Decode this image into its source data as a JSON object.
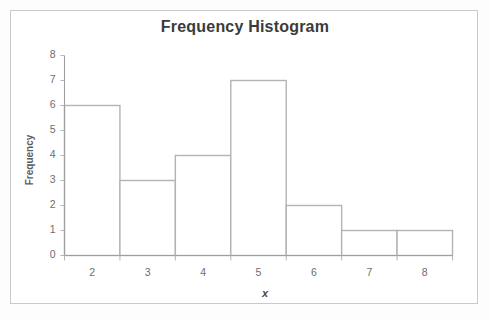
{
  "chart_data": {
    "type": "bar",
    "title": "Frequency Histogram",
    "xlabel": "x",
    "ylabel": "Frequency",
    "categories": [
      "2",
      "3",
      "4",
      "5",
      "6",
      "7",
      "8"
    ],
    "values": [
      6,
      3,
      4,
      7,
      2,
      1,
      1
    ],
    "bin_edges": [
      1.5,
      2.5,
      3.5,
      4.5,
      5.5,
      6.5,
      7.5,
      8.5
    ],
    "ylim": [
      0,
      8
    ],
    "xlim": [
      1.5,
      8.5
    ],
    "ytick_labels": [
      "0",
      "1",
      "2",
      "3",
      "4",
      "5",
      "6",
      "7",
      "8"
    ],
    "ytick_values": [
      0,
      1,
      2,
      3,
      4,
      5,
      6,
      7,
      8
    ],
    "xtick_labels": [
      "2",
      "3",
      "4",
      "5",
      "6",
      "7",
      "8"
    ],
    "grid": false,
    "legend": null,
    "bar_fill": "#ffffff",
    "bar_stroke": "#b3b3b3",
    "axis_color": "#9e9e9e",
    "title_color": "#3b3b3b",
    "tick_label_color": "#6d6d6d",
    "frame_border_color": "#c9c9c9",
    "background_color": "#ffffff"
  }
}
